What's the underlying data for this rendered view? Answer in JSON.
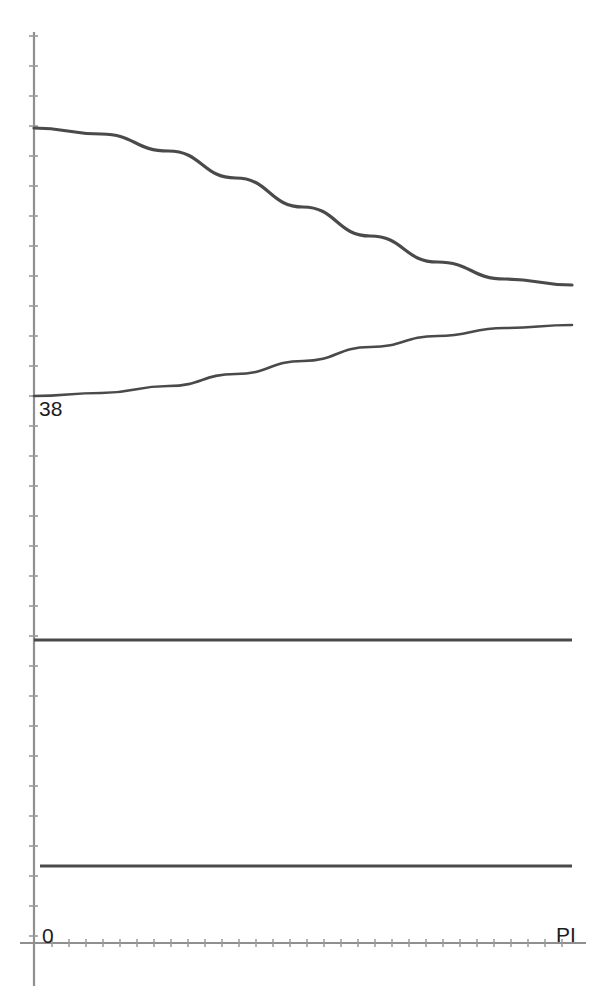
{
  "chart_data": {
    "type": "line",
    "title": "",
    "subtitle": "",
    "xlabel": "",
    "ylabel": "",
    "grid": false,
    "legend": null,
    "axis_color": "#8a8a8a",
    "curve_color": "#4a4a4a",
    "x_axis": {
      "tick_labels": [
        "0",
        "PI"
      ],
      "tick_values": [
        0,
        3.14159
      ],
      "range": [
        0,
        3.14159
      ],
      "minor_tick_count": 31
    },
    "y_axis": {
      "tick_labels": [
        "38"
      ],
      "tick_values": [
        38
      ],
      "minor_tick_count": 31
    },
    "series": [
      {
        "name": "descending-curve",
        "shape": "cosine-decreasing",
        "x": [
          0,
          0.3927,
          0.7854,
          1.1781,
          1.5708,
          1.9635,
          2.3562,
          2.7489,
          3.14159
        ],
        "y_pixels": [
          128,
          134,
          151,
          178,
          207,
          236,
          262,
          279,
          285
        ],
        "start_value": 128,
        "end_value": 285
      },
      {
        "name": "rising-curve",
        "shape": "cosine-increasing",
        "x": [
          0,
          0.3927,
          0.7854,
          1.1781,
          1.5708,
          1.9635,
          2.3562,
          2.7489,
          3.14159
        ],
        "y_pixels": [
          396,
          393,
          386,
          374,
          361,
          347,
          336,
          328,
          325
        ],
        "start_value": 396,
        "end_value": 325
      },
      {
        "name": "upper-flat-line",
        "shape": "horizontal",
        "x": [
          0,
          3.14159
        ],
        "y_pixels": [
          640,
          640
        ],
        "start_value": 640,
        "end_value": 640
      },
      {
        "name": "lower-flat-line",
        "shape": "horizontal",
        "x": [
          0.035,
          3.14159
        ],
        "y_pixels": [
          866,
          866
        ],
        "start_value": 866,
        "end_value": 866
      }
    ]
  },
  "labels": {
    "y_tick_38": "38",
    "x_tick_zero": "0",
    "x_tick_pi": "PI"
  }
}
